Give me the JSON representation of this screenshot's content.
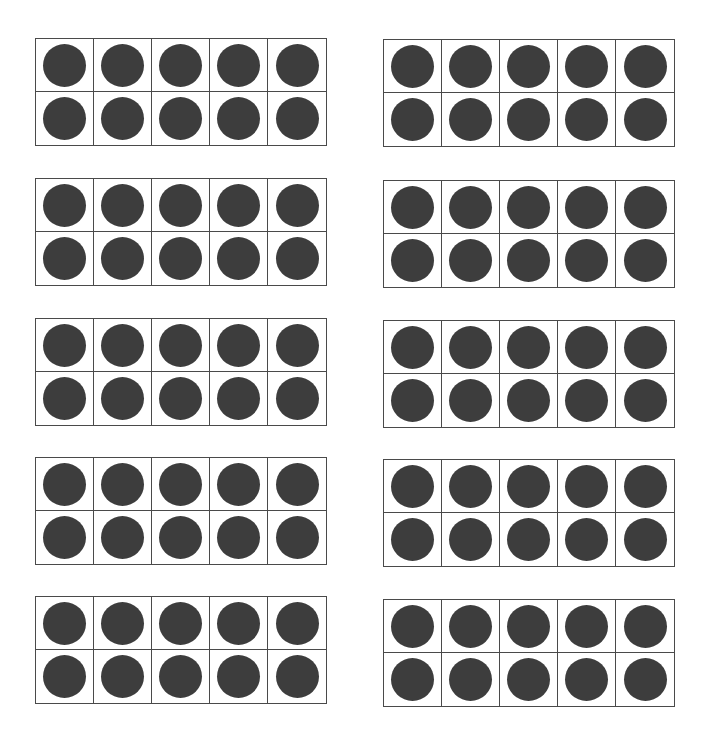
{
  "worksheet": {
    "layout": {
      "columns": 2,
      "rows": 5
    },
    "dot_color": "#3d3d3d",
    "line_color": "#4a4a4a",
    "frames": [
      {
        "id": 1,
        "column": "left",
        "row": 1,
        "filled": 10,
        "capacity": 10
      },
      {
        "id": 2,
        "column": "right",
        "row": 1,
        "filled": 10,
        "capacity": 10
      },
      {
        "id": 3,
        "column": "left",
        "row": 2,
        "filled": 10,
        "capacity": 10
      },
      {
        "id": 4,
        "column": "right",
        "row": 2,
        "filled": 10,
        "capacity": 10
      },
      {
        "id": 5,
        "column": "left",
        "row": 3,
        "filled": 10,
        "capacity": 10
      },
      {
        "id": 6,
        "column": "right",
        "row": 3,
        "filled": 10,
        "capacity": 10
      },
      {
        "id": 7,
        "column": "left",
        "row": 4,
        "filled": 10,
        "capacity": 10
      },
      {
        "id": 8,
        "column": "right",
        "row": 4,
        "filled": 10,
        "capacity": 10
      },
      {
        "id": 9,
        "column": "left",
        "row": 5,
        "filled": 10,
        "capacity": 10
      },
      {
        "id": 10,
        "column": "right",
        "row": 5,
        "filled": 10,
        "capacity": 10
      }
    ],
    "total_dots": 100
  }
}
